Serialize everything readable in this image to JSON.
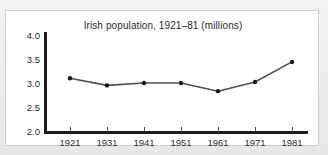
{
  "figure": {
    "title": "Irish population, 1921–81 (millions)",
    "background_color": "#ffffff",
    "page_background_color": "#e9e9e9",
    "border_color": "#cfcfcf",
    "axis_color": "#1d1d1d",
    "line_color": "#4f4f4f",
    "marker_color": "#1a1a1a"
  },
  "chart_data": {
    "type": "line",
    "title": "Irish population, 1921–81 (millions)",
    "xlabel": "",
    "ylabel": "",
    "categories": [
      "1921",
      "1931",
      "1941",
      "1951",
      "1961",
      "1971",
      "1981"
    ],
    "x": [
      1921,
      1931,
      1941,
      1951,
      1961,
      1971,
      1981
    ],
    "values": [
      3.1,
      2.95,
      3.0,
      3.0,
      2.83,
      3.02,
      3.44
    ],
    "ylim": [
      2.0,
      4.0
    ],
    "yticks": [
      2.0,
      2.5,
      3.0,
      3.5,
      4.0
    ],
    "ytick_labels": [
      "2.0",
      "2.5",
      "3.0",
      "3.5",
      "4.0"
    ],
    "xticks": [
      1921,
      1931,
      1941,
      1951,
      1961,
      1971,
      1981
    ],
    "xtick_labels": [
      "1921",
      "1931",
      "1941",
      "1951",
      "1961",
      "1971",
      "1981"
    ],
    "grid": false,
    "legend": false,
    "markers": "filled-circle",
    "series": [
      {
        "name": "Irish population (millions)",
        "values": [
          3.1,
          2.95,
          3.0,
          3.0,
          2.83,
          3.02,
          3.44
        ]
      }
    ]
  }
}
